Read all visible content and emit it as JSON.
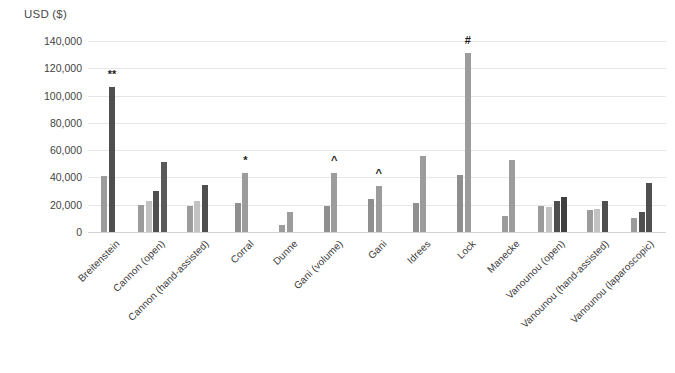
{
  "chart_data": {
    "type": "bar",
    "title": "",
    "xlabel": "",
    "ylabel": "USD ($)",
    "ylim": [
      0,
      140000
    ],
    "ytick_values": [
      140000,
      120000,
      100000,
      80000,
      60000,
      40000,
      20000,
      0
    ],
    "ytick_labels": [
      "140,000",
      "120,000",
      "100,000",
      "80,000",
      "60,000",
      "40,000",
      "20,000",
      "0"
    ],
    "grid": true,
    "legend": "none",
    "colors": {
      "light_gray": "#bfbfbf",
      "medium_gray": "#8c8c8c",
      "dark_gray": "#595959",
      "darkest_gray": "#404040",
      "gridline": "#e6e6e6",
      "axis": "#d2d2d2",
      "text": "#3b3b3b"
    },
    "categories": [
      "Breitenstein",
      "Cannon (open)",
      "Cannon (hand-assisted)",
      "Corral",
      "Dunne",
      "Gani (volume)",
      "Gani",
      "Idrees",
      "Lock",
      "Manecke",
      "Vanounou (open)",
      "Vanounou (hand-assisted)",
      "Vanounou (laparoscopic)"
    ],
    "groups": [
      {
        "category": "Breitenstein",
        "annotation": "**",
        "annotation_on_bar": 1,
        "bars": [
          {
            "value": 41000,
            "color": "#9c9c9c"
          },
          {
            "value": 106000,
            "color": "#4f4f4f"
          }
        ]
      },
      {
        "category": "Cannon (open)",
        "annotation": "",
        "annotation_on_bar": -1,
        "bars": [
          {
            "value": 20000,
            "color": "#9c9c9c"
          },
          {
            "value": 22500,
            "color": "#c2c2c2"
          },
          {
            "value": 30000,
            "color": "#4f4f4f"
          },
          {
            "value": 51000,
            "color": "#595959"
          }
        ]
      },
      {
        "category": "Cannon (hand-assisted)",
        "annotation": "",
        "annotation_on_bar": -1,
        "bars": [
          {
            "value": 19000,
            "color": "#9c9c9c"
          },
          {
            "value": 23000,
            "color": "#c2c2c2"
          },
          {
            "value": 34500,
            "color": "#4f4f4f"
          }
        ]
      },
      {
        "category": "Corral",
        "annotation": "*",
        "annotation_on_bar": 1,
        "bars": [
          {
            "value": 21000,
            "color": "#8f8f8f"
          },
          {
            "value": 43000,
            "color": "#9c9c9c"
          }
        ]
      },
      {
        "category": "Dunne",
        "annotation": "",
        "annotation_on_bar": -1,
        "bars": [
          {
            "value": 5000,
            "color": "#9c9c9c"
          },
          {
            "value": 14500,
            "color": "#9c9c9c"
          }
        ]
      },
      {
        "category": "Gani (volume)",
        "annotation": "^",
        "annotation_on_bar": 1,
        "bars": [
          {
            "value": 19000,
            "color": "#8f8f8f"
          },
          {
            "value": 43500,
            "color": "#9c9c9c"
          }
        ]
      },
      {
        "category": "Gani",
        "annotation": "^",
        "annotation_on_bar": 1,
        "bars": [
          {
            "value": 24000,
            "color": "#8f8f8f"
          },
          {
            "value": 34000,
            "color": "#9c9c9c"
          }
        ]
      },
      {
        "category": "Idrees",
        "annotation": "",
        "annotation_on_bar": -1,
        "bars": [
          {
            "value": 21000,
            "color": "#8f8f8f"
          },
          {
            "value": 55500,
            "color": "#9c9c9c"
          }
        ]
      },
      {
        "category": "Lock",
        "annotation": "#",
        "annotation_on_bar": 1,
        "bars": [
          {
            "value": 42000,
            "color": "#8f8f8f"
          },
          {
            "value": 131000,
            "color": "#9c9c9c"
          }
        ]
      },
      {
        "category": "Manecke",
        "annotation": "",
        "annotation_on_bar": -1,
        "bars": [
          {
            "value": 12000,
            "color": "#9c9c9c"
          },
          {
            "value": 53000,
            "color": "#9c9c9c"
          }
        ]
      },
      {
        "category": "Vanounou (open)",
        "annotation": "",
        "annotation_on_bar": -1,
        "bars": [
          {
            "value": 19000,
            "color": "#9c9c9c"
          },
          {
            "value": 18000,
            "color": "#c2c2c2"
          },
          {
            "value": 23000,
            "color": "#4f4f4f"
          },
          {
            "value": 26000,
            "color": "#3f3f3f"
          }
        ]
      },
      {
        "category": "Vanounou (hand-assisted)",
        "annotation": "",
        "annotation_on_bar": -1,
        "bars": [
          {
            "value": 16000,
            "color": "#9c9c9c"
          },
          {
            "value": 17000,
            "color": "#c2c2c2"
          },
          {
            "value": 23000,
            "color": "#4f4f4f"
          }
        ]
      },
      {
        "category": "Vanounou (laparoscopic)",
        "annotation": "",
        "annotation_on_bar": -1,
        "bars": [
          {
            "value": 10000,
            "color": "#9c9c9c"
          },
          {
            "value": 15000,
            "color": "#4f4f4f"
          },
          {
            "value": 36000,
            "color": "#4f4f4f"
          }
        ]
      }
    ]
  }
}
